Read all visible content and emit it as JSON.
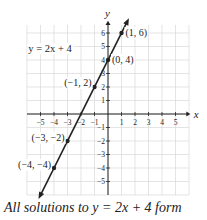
{
  "chart_data": {
    "type": "line",
    "title": "",
    "equation_label": "y = 2x + 4",
    "xlabel": "x",
    "ylabel": "y",
    "xlim": [
      -5,
      5
    ],
    "ylim": [
      -5,
      6
    ],
    "x_ticks": [
      -5,
      -4,
      -3,
      -2,
      -1,
      1,
      2,
      3,
      4,
      5
    ],
    "y_ticks": [
      -5,
      -4,
      -3,
      -2,
      -1,
      1,
      2,
      3,
      4,
      5,
      6
    ],
    "grid": true,
    "series": [
      {
        "name": "y = 2x + 4",
        "slope": 2,
        "intercept": 4
      }
    ],
    "points": [
      {
        "x": 1,
        "y": 6,
        "label": "(1, 6)"
      },
      {
        "x": 0,
        "y": 4,
        "label": "(0, 4)"
      },
      {
        "x": -1,
        "y": 2,
        "label": "(−1, 2)"
      },
      {
        "x": -3,
        "y": -2,
        "label": "(−3, −2)"
      },
      {
        "x": -4,
        "y": -4,
        "label": "(−4, −4)"
      }
    ]
  },
  "caption": "All solutions to y = 2x + 4 form"
}
